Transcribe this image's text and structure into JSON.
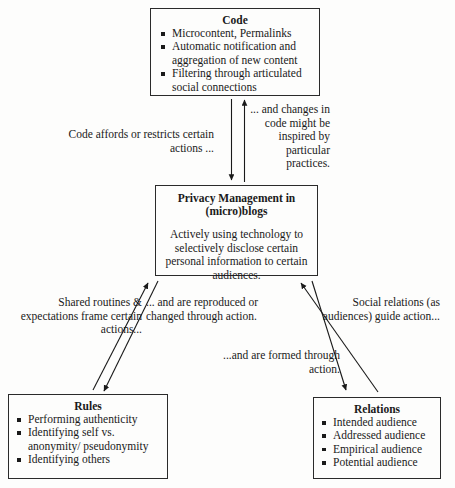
{
  "diagram": {
    "boxes": {
      "code": {
        "title": "Code",
        "items": [
          "Microcontent, Permalinks",
          "Automatic notification and aggregation of new content",
          "Filtering through articulated social connections"
        ]
      },
      "privacy": {
        "title_line1": "Privacy Management in",
        "title_line2": "(micro)blogs",
        "body": "Actively using technology to selectively disclose certain personal information to certain audiences."
      },
      "rules": {
        "title": "Rules",
        "items": [
          "Performing authenticity",
          "Identifying self vs. anonymity/ pseudonymity",
          "Identifying others"
        ]
      },
      "relations": {
        "title": "Relations",
        "items": [
          "Intended audience",
          "Addressed audience",
          "Empirical audience",
          "Potential audience"
        ]
      }
    },
    "edge_labels": {
      "code_affords": "Code affords or restricts certain actions ...",
      "code_changes": "... and changes in code might be inspired by particular practices.",
      "shared_routines": "Shared routines & expectations frame certain actions...",
      "reproduced": "... and are reproduced or changed through action.",
      "social_relations": "Social relations (as audiences) guide action...",
      "formed_through": "...and are formed through action."
    },
    "colors": {
      "stroke": "#2a2a2a",
      "text": "#1a1a1a",
      "background": "#fdfdfc"
    }
  }
}
